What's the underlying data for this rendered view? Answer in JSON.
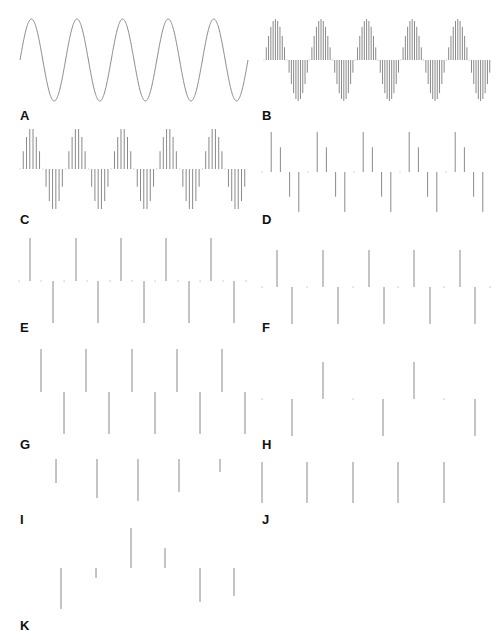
{
  "figure": {
    "stroke_color": "#8a8a8a",
    "label_color": "#111111",
    "panels": [
      {
        "label": "A",
        "type": "continuous-sine",
        "label_x": 20,
        "label_y": 109,
        "x0": 20,
        "x1": 248,
        "baseline": 60,
        "amp": 41,
        "periods": 5
      },
      {
        "label": "B",
        "type": "sampled-sine",
        "label_x": 262,
        "label_y": 109,
        "x0": 264,
        "x1": 492,
        "baseline": 60,
        "amp": 41,
        "periods": 5,
        "samples_per_period": 20
      },
      {
        "label": "C",
        "type": "sampled-sine",
        "label_x": 20,
        "label_y": 213,
        "x0": 20,
        "x1": 248,
        "baseline": 169,
        "amp": 41,
        "periods": 5,
        "samples_per_period": 14
      },
      {
        "label": "D",
        "type": "sampled-sine",
        "label_x": 262,
        "label_y": 213,
        "x0": 262,
        "x1": 492,
        "baseline": 172,
        "amp": 42,
        "periods": 5,
        "samples_per_period": 5
      },
      {
        "label": "E",
        "type": "stems",
        "label_x": 20,
        "label_y": 321,
        "baseline": 281,
        "stem_color": "#8a8a8a",
        "stems": [
          [
            30,
            -43
          ],
          [
            53,
            42
          ],
          [
            76,
            -43
          ],
          [
            98,
            42
          ],
          [
            121,
            -43
          ],
          [
            144,
            42
          ],
          [
            166,
            -43
          ],
          [
            189,
            42
          ],
          [
            211,
            -43
          ],
          [
            234,
            42
          ]
        ],
        "dots": [
          19,
          41,
          64,
          87,
          110,
          132,
          155,
          178,
          200,
          223,
          246
        ]
      },
      {
        "label": "F",
        "type": "stems",
        "label_x": 262,
        "label_y": 321,
        "baseline": 287,
        "stems": [
          [
            277,
            -37
          ],
          [
            292,
            37
          ],
          [
            323,
            -37
          ],
          [
            338,
            37
          ],
          [
            369,
            -37
          ],
          [
            384,
            37
          ],
          [
            414,
            -37
          ],
          [
            430,
            37
          ],
          [
            460,
            -37
          ],
          [
            475,
            37
          ]
        ],
        "dots": [
          262,
          307,
          353,
          398,
          444,
          490
        ]
      },
      {
        "label": "G",
        "type": "stems",
        "label_x": 20,
        "label_y": 438,
        "baseline": 392,
        "stems": [
          [
            41,
            -43
          ],
          [
            64,
            42
          ],
          [
            86,
            -43
          ],
          [
            109,
            42
          ],
          [
            132,
            -43
          ],
          [
            155,
            42
          ],
          [
            177,
            -43
          ],
          [
            200,
            42
          ],
          [
            222,
            -43
          ],
          [
            245,
            42
          ]
        ],
        "dots": []
      },
      {
        "label": "H",
        "type": "stems",
        "label_x": 262,
        "label_y": 438,
        "baseline": 399,
        "stems": [
          [
            292,
            37
          ],
          [
            323,
            -37
          ],
          [
            383,
            37
          ],
          [
            414,
            -37
          ],
          [
            475,
            37
          ]
        ],
        "dots": [
          262,
          353,
          444
        ]
      },
      {
        "label": "I",
        "type": "stems",
        "label_x": 20,
        "label_y": 513,
        "baseline": 459,
        "stems": [
          [
            56,
            24
          ],
          [
            97,
            39
          ],
          [
            138,
            42
          ],
          [
            179,
            33
          ],
          [
            220,
            13
          ]
        ],
        "dots": []
      },
      {
        "label": "J",
        "type": "stems",
        "label_x": 262,
        "label_y": 513,
        "baseline": 462,
        "stems": [
          [
            262,
            41
          ],
          [
            307,
            41
          ],
          [
            353,
            41
          ],
          [
            398,
            41
          ],
          [
            444,
            41
          ]
        ],
        "dots": []
      },
      {
        "label": "K",
        "type": "stems",
        "label_x": 20,
        "label_y": 619,
        "baseline": 568,
        "stems": [
          [
            61,
            41
          ],
          [
            96,
            10
          ],
          [
            131,
            -40
          ],
          [
            165,
            -20
          ],
          [
            200,
            34
          ],
          [
            234,
            28
          ]
        ],
        "dots": []
      }
    ]
  },
  "chart_data": {
    "type": "stem",
    "title": "",
    "panels": [
      {
        "label": "A",
        "kind": "continuous",
        "periods": 5
      },
      {
        "label": "B",
        "kind": "sampled",
        "periods": 5,
        "samples_per_period": 20
      },
      {
        "label": "C",
        "kind": "sampled",
        "periods": 5,
        "samples_per_period": 14
      },
      {
        "label": "D",
        "kind": "sampled",
        "periods": 5,
        "samples_per_period": 5
      },
      {
        "label": "E",
        "kind": "sampled",
        "samples_per_period": 2,
        "pattern": "alternating +1/-1 with zero samples between"
      },
      {
        "label": "F",
        "kind": "sampled",
        "samples_per_period": 2,
        "pattern": "alternating +/- with zero samples"
      },
      {
        "label": "G",
        "kind": "sampled",
        "samples_per_period": 2,
        "pattern": "alternating +1/-1"
      },
      {
        "label": "H",
        "kind": "sampled",
        "pattern": "-, +, 0 repeating"
      },
      {
        "label": "I",
        "kind": "sampled",
        "values": [
          -0.57,
          -0.93,
          -1.0,
          -0.79,
          -0.31
        ]
      },
      {
        "label": "J",
        "kind": "sampled",
        "values": [
          -1,
          -1,
          -1,
          -1,
          -1
        ]
      },
      {
        "label": "K",
        "kind": "sampled",
        "values": [
          -1.0,
          -0.25,
          0.98,
          0.49,
          -0.83,
          -0.68
        ]
      }
    ]
  }
}
